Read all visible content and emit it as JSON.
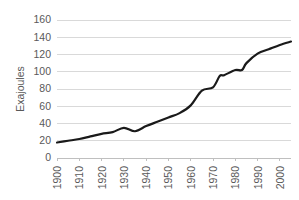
{
  "chart_data": {
    "type": "line",
    "title": "",
    "xlabel": "",
    "ylabel": "Exajoules",
    "xlim": [
      1900,
      2005
    ],
    "ylim": [
      0,
      160
    ],
    "grid": true,
    "legend": false,
    "y_ticks": [
      0,
      20,
      40,
      60,
      80,
      100,
      120,
      140,
      160
    ],
    "x_ticks": [
      1900,
      1910,
      1920,
      1930,
      1940,
      1950,
      1960,
      1970,
      1980,
      1990,
      2000
    ],
    "x_tick_labels": [
      "1900",
      "1910",
      "1920",
      "1930",
      "1940",
      "1950",
      "1960",
      "1970",
      "1980",
      "1990",
      "2000"
    ],
    "y_tick_labels": [
      "0",
      "20",
      "40",
      "60",
      "80",
      "100",
      "120",
      "140",
      "160"
    ],
    "line_color": "#1a1a1a",
    "grid_color": "#d9d9d9",
    "axis_color": "#bfbfbf",
    "text_color": "#595959",
    "background_color": "#ffffff",
    "series": [
      {
        "name": "World energy consumption",
        "x": [
          1900,
          1905,
          1910,
          1915,
          1920,
          1925,
          1930,
          1935,
          1940,
          1945,
          1950,
          1955,
          1960,
          1965,
          1970,
          1973,
          1975,
          1980,
          1983,
          1985,
          1990,
          1995,
          2000,
          2005
        ],
        "values": [
          18,
          20,
          22,
          25,
          28,
          30,
          35,
          31,
          37,
          42,
          47,
          52,
          61,
          78,
          82,
          95,
          96,
          102,
          102,
          110,
          121,
          126,
          131,
          135
        ]
      }
    ]
  },
  "axis": {
    "ylabel": "Exajoules"
  }
}
